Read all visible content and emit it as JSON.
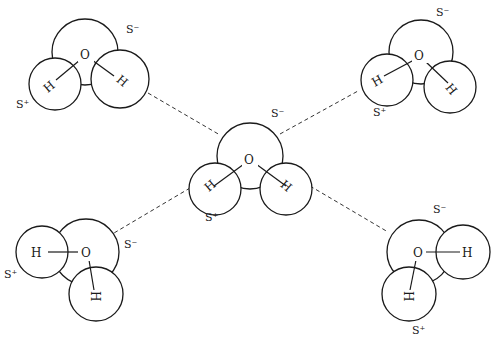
{
  "diagram": {
    "atom_labels": {
      "oxygen": "O",
      "hydrogen": "H"
    },
    "charges": {
      "partial_negative": "S⁻",
      "partial_positive": "S⁺"
    },
    "molecules": [
      {
        "id": "top-left",
        "charge_neg": "S⁻",
        "charge_pos": "S⁺"
      },
      {
        "id": "top-right",
        "charge_neg": "S⁻",
        "charge_pos": "S⁺"
      },
      {
        "id": "center",
        "charge_neg": "S⁻",
        "charge_pos": "S⁺"
      },
      {
        "id": "bottom-left",
        "charge_neg": "S⁻",
        "charge_pos": "S⁺"
      },
      {
        "id": "bottom-right",
        "charge_neg": "S⁻",
        "charge_pos": "S⁺"
      }
    ],
    "hydrogen_bonds": [
      {
        "from": "top-left",
        "to": "center",
        "style": "dashed"
      },
      {
        "from": "top-right",
        "to": "center",
        "style": "dashed"
      },
      {
        "from": "bottom-left",
        "to": "center",
        "style": "dashed"
      },
      {
        "from": "bottom-right",
        "to": "center",
        "style": "dashed"
      }
    ]
  }
}
